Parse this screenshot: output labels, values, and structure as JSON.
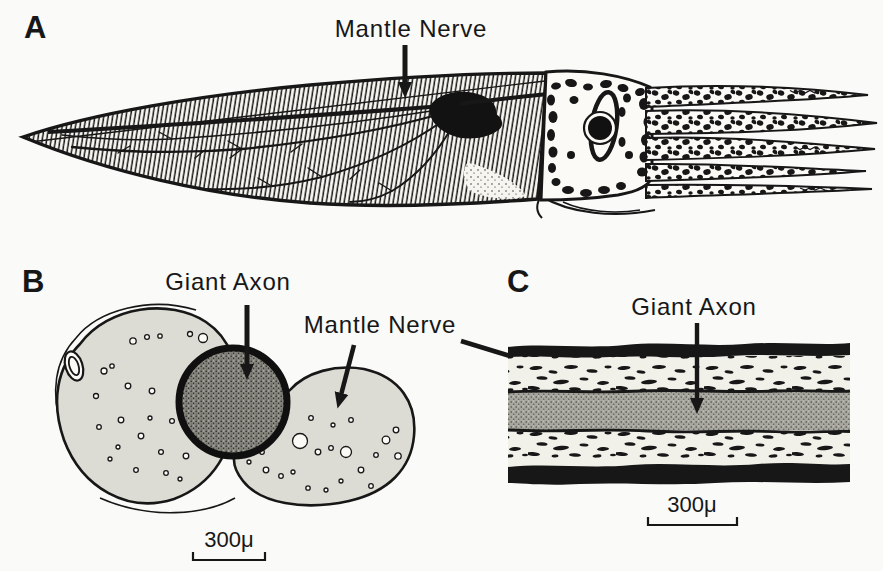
{
  "figure": {
    "colors": {
      "background": "#fafaf8",
      "ink": "#171717",
      "nerve_lobe_fill": "#dcdbd4",
      "giant_axon_stipple": "#83837c",
      "longitudinal_axon_stipple": "#a8a79f"
    }
  },
  "panel_a": {
    "letter": "A",
    "mantle_nerve_label": "Mantle Nerve"
  },
  "panel_b": {
    "letter": "B",
    "giant_axon_label": "Giant Axon",
    "mantle_nerve_label": "Mantle Nerve",
    "scale_bar_label": "300μ"
  },
  "panel_c": {
    "letter": "C",
    "giant_axon_label": "Giant Axon",
    "scale_bar_label": "300μ"
  }
}
